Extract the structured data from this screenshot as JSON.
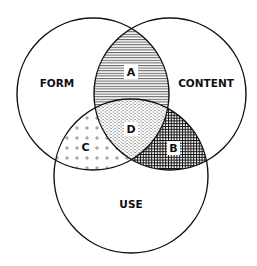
{
  "diagram": {
    "type": "venn",
    "sets": [
      {
        "id": "form",
        "label": "FORM"
      },
      {
        "id": "content",
        "label": "CONTENT"
      },
      {
        "id": "use",
        "label": "USE"
      }
    ],
    "regions": [
      {
        "id": "A",
        "label": "A",
        "sets": [
          "form",
          "content"
        ],
        "pattern": "horizontal-lines"
      },
      {
        "id": "B",
        "label": "B",
        "sets": [
          "content",
          "use"
        ],
        "pattern": "crosshatch-grid"
      },
      {
        "id": "C",
        "label": "C",
        "sets": [
          "form",
          "use"
        ],
        "pattern": "sparse-plus"
      },
      {
        "id": "D",
        "label": "D",
        "sets": [
          "form",
          "content",
          "use"
        ],
        "pattern": "fine-dashes"
      }
    ],
    "colors": {
      "stroke": "#111111",
      "background": "#ffffff"
    }
  }
}
